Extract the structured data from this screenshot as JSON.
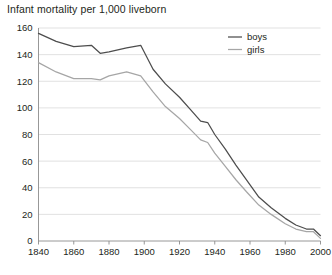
{
  "chart_data": {
    "type": "line",
    "title": "Infant mortality per 1,000 liveborn",
    "xlabel": "",
    "ylabel": "",
    "xlim": [
      1840,
      2000
    ],
    "ylim": [
      0,
      160
    ],
    "xticks": [
      1840,
      1860,
      1880,
      1900,
      1920,
      1940,
      1960,
      1980,
      2000
    ],
    "yticks": [
      0,
      20,
      40,
      60,
      80,
      100,
      120,
      140,
      160
    ],
    "grid": "horizontal",
    "legend_position": "top-right",
    "series": [
      {
        "name": "boys",
        "color": "#4d4d4d",
        "x": [
          1840,
          1850,
          1860,
          1870,
          1875,
          1880,
          1890,
          1898,
          1905,
          1912,
          1920,
          1926,
          1932,
          1936,
          1940,
          1946,
          1952,
          1958,
          1965,
          1972,
          1980,
          1986,
          1992,
          1996,
          2000
        ],
        "values": [
          156,
          150,
          146,
          147,
          141,
          142,
          145,
          147,
          129,
          118,
          108,
          99,
          90,
          89,
          80,
          69,
          57,
          46,
          33,
          25,
          17,
          12,
          9,
          9,
          4
        ]
      },
      {
        "name": "girls",
        "color": "#a6a6a6",
        "x": [
          1840,
          1850,
          1860,
          1870,
          1875,
          1880,
          1890,
          1898,
          1905,
          1912,
          1920,
          1926,
          1932,
          1936,
          1940,
          1946,
          1952,
          1958,
          1965,
          1972,
          1980,
          1986,
          1992,
          1996,
          2000
        ],
        "values": [
          134,
          127,
          122,
          122,
          121,
          124,
          127,
          124,
          112,
          101,
          92,
          84,
          76,
          74,
          66,
          56,
          46,
          37,
          27,
          20,
          13,
          9,
          7,
          7,
          2
        ]
      }
    ],
    "legend": [
      {
        "label": "boys",
        "color": "#4d4d4d"
      },
      {
        "label": "girls",
        "color": "#a6a6a6"
      }
    ]
  },
  "axes": {
    "y_tick_labels": [
      "160",
      "140",
      "120",
      "100",
      "80",
      "60",
      "40",
      "20",
      "0"
    ],
    "x_tick_labels": [
      "1840",
      "1860",
      "1880",
      "1900",
      "1920",
      "1940",
      "1960",
      "1980",
      "2000"
    ]
  }
}
